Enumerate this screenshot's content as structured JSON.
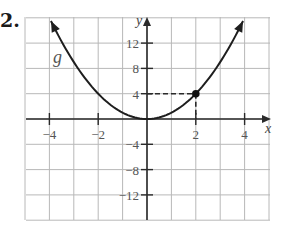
{
  "problem": {
    "number": "2."
  },
  "chart_data": {
    "type": "line",
    "title": "",
    "function_label": "g",
    "function": "g(x) = x^2",
    "xlabel": "x",
    "ylabel": "y",
    "xlim": [
      -5,
      5
    ],
    "ylim": [
      -16,
      16
    ],
    "x_ticks": [
      -4,
      -2,
      2,
      4
    ],
    "x_tick_labels": [
      "−4",
      "−2",
      "2",
      "4"
    ],
    "y_ticks": [
      12,
      8,
      4,
      -4,
      -8,
      -12
    ],
    "y_tick_labels": [
      "12",
      "8",
      "4",
      "−4",
      "−8",
      "−12"
    ],
    "grid": true,
    "x_grid_step": 1,
    "y_grid_step": 4,
    "series": [
      {
        "name": "g",
        "x": [
          -4,
          -3,
          -2,
          -1,
          0,
          1,
          2,
          3,
          4
        ],
        "y": [
          16,
          9,
          4,
          1,
          0,
          1,
          4,
          9,
          16
        ]
      }
    ],
    "highlighted_point": {
      "x": 2,
      "y": 4,
      "guides": "dashed"
    },
    "arrows": "both ends of curve"
  }
}
